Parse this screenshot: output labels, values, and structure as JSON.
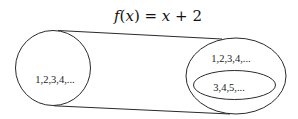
{
  "diagram": {
    "title": {
      "f": "f",
      "open": "(",
      "x1": "x",
      "close": ")",
      "eq": " = ",
      "x2": "x",
      "rest": " + 2",
      "full": "f(x) = x + 2"
    },
    "domain_set": {
      "label": "1,2,3,4,..."
    },
    "codomain_set": {
      "label": "1,2,3,4,..."
    },
    "range_set": {
      "label": "3,4,5,..."
    },
    "colors": {
      "stroke": "#2a2a2a",
      "text": "#222222",
      "background": "#ffffff"
    }
  }
}
